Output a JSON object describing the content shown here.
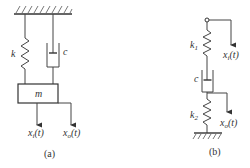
{
  "diagram": {
    "panels": [
      {
        "id": "a",
        "caption": "(a)",
        "elements": {
          "spring": {
            "label": "k"
          },
          "damper": {
            "label": "c"
          },
          "mass": {
            "label": "m"
          },
          "input": {
            "label_main": "x",
            "label_sub": "i",
            "label_tail": "(t)"
          },
          "output": {
            "label_main": "x",
            "label_sub": "o",
            "label_tail": "(t)"
          }
        }
      },
      {
        "id": "b",
        "caption": "(b)",
        "elements": {
          "spring1": {
            "label_main": "k",
            "label_sub": "1"
          },
          "damper": {
            "label": "c"
          },
          "spring2": {
            "label_main": "k",
            "label_sub": "2"
          },
          "input": {
            "label_main": "x",
            "label_sub": "i",
            "label_tail": "(t)"
          },
          "output": {
            "label_main": "x",
            "label_sub": "o",
            "label_tail": "(t)"
          }
        }
      }
    ],
    "colors": {
      "stroke": "#444444",
      "background": "#ffffff"
    }
  }
}
